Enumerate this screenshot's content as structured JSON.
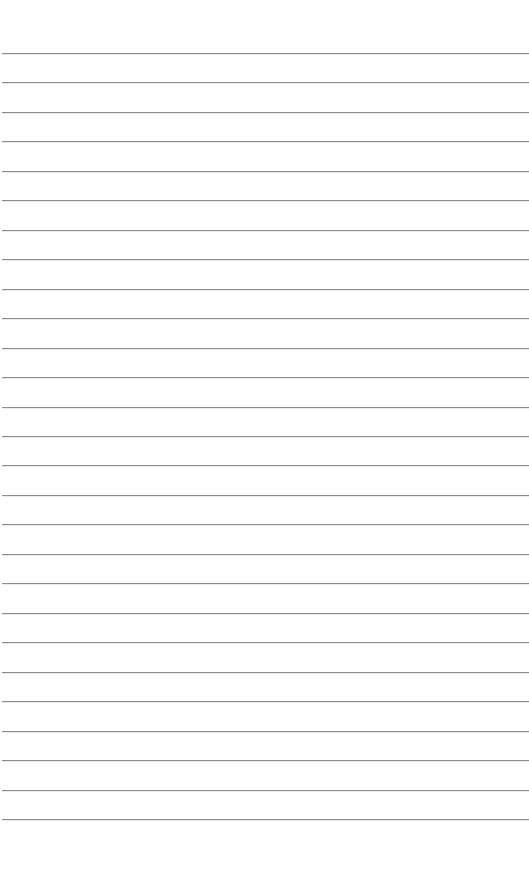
{
  "page": {
    "type": "lined-paper",
    "background_color": "#ffffff",
    "rule_color": "#8c8c8c",
    "rule_count": 27,
    "first_rule_y": 53,
    "rule_spacing": 29.46,
    "text_lines": []
  }
}
